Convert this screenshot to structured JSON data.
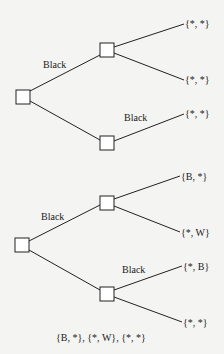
{
  "trees": [
    {
      "edge_labels": [
        "Black",
        "Black"
      ],
      "leaves": [
        "{*, *}",
        "{*, *}",
        "{*, *}"
      ]
    },
    {
      "edge_labels": [
        "Black",
        "Black"
      ],
      "leaves": [
        "{B, *}",
        "{*, W}",
        "{*, B}",
        "{*, *}"
      ],
      "caption": "{B, *}, {*, W}, {*, *}"
    }
  ],
  "colors": {
    "line": "#222222",
    "background": "#f4f4f2",
    "node_fill": "#ffffff"
  }
}
